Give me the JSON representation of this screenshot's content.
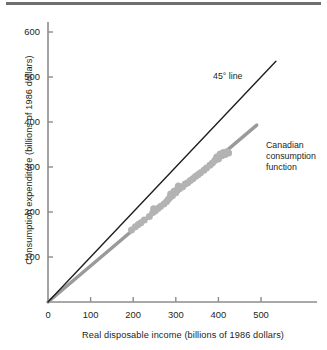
{
  "figure": {
    "name": "canadian-consumption-function-scatter",
    "background": "#ffffff",
    "top_rule_color": "#6f6f6f"
  },
  "chart_data": {
    "type": "scatter",
    "title": "",
    "xlabel": "Real disposable income (billions of 1986 dollars)",
    "ylabel": "Consumption expenditure (billions of 1986 dollars)",
    "xlim": [
      0,
      570
    ],
    "ylim": [
      0,
      640
    ],
    "xticks": [
      0,
      100,
      200,
      300,
      400,
      500
    ],
    "xtick_labels": [
      "0",
      "100",
      "200",
      "300",
      "400",
      "500"
    ],
    "yticks": [
      100,
      200,
      300,
      400,
      500,
      600
    ],
    "ytick_labels": [
      "100",
      "200",
      "300",
      "400",
      "500",
      "600"
    ],
    "grid": false,
    "legend": "none",
    "series": [
      {
        "name": "Canadian consumption function",
        "type": "line",
        "color": "#9a9a9a",
        "width": 3.4,
        "x": [
          0,
          490
        ],
        "y": [
          0,
          393
        ]
      },
      {
        "name": "45° line",
        "type": "line",
        "color": "#231f20",
        "width": 1.4,
        "x": [
          0,
          535
        ],
        "y": [
          0,
          535
        ]
      },
      {
        "name": "Observations",
        "type": "scatter",
        "color": "#b3b3b3",
        "marker": "circle",
        "marker_size": 7,
        "points": [
          [
            196,
            160
          ],
          [
            205,
            167
          ],
          [
            212,
            172
          ],
          [
            218,
            176
          ],
          [
            226,
            182
          ],
          [
            238,
            190
          ],
          [
            246,
            199
          ],
          [
            248,
            207
          ],
          [
            252,
            203
          ],
          [
            258,
            208
          ],
          [
            264,
            212
          ],
          [
            272,
            218
          ],
          [
            278,
            223
          ],
          [
            282,
            228
          ],
          [
            286,
            232
          ],
          [
            288,
            240
          ],
          [
            292,
            236
          ],
          [
            296,
            246
          ],
          [
            300,
            243
          ],
          [
            304,
            251
          ],
          [
            306,
            258
          ],
          [
            310,
            253
          ],
          [
            316,
            256
          ],
          [
            322,
            262
          ],
          [
            328,
            265
          ],
          [
            334,
            270
          ],
          [
            340,
            274
          ],
          [
            346,
            279
          ],
          [
            352,
            283
          ],
          [
            358,
            287
          ],
          [
            366,
            293
          ],
          [
            372,
            298
          ],
          [
            380,
            304
          ],
          [
            386,
            309
          ],
          [
            392,
            315
          ],
          [
            396,
            322
          ],
          [
            400,
            318
          ],
          [
            404,
            329
          ],
          [
            408,
            325
          ],
          [
            412,
            332
          ],
          [
            416,
            328
          ],
          [
            420,
            334
          ],
          [
            424,
            331
          ]
        ]
      }
    ],
    "annotations": [
      {
        "name": "forty-five-degree-line-label",
        "text": "45° line",
        "x": 390,
        "y": 462
      },
      {
        "name": "consumption-function-label",
        "text": "Canadian\nconsumption\nfunction",
        "x": 515,
        "y": 306
      }
    ]
  }
}
